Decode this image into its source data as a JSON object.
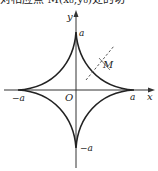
{
  "caption": "对相应点 M(x₀,y₀)处的切",
  "figure": {
    "type": "astroid",
    "equation": "x^(2/3) + y^(2/3) = a^(2/3)",
    "labels": {
      "x_axis": "x",
      "y_axis": "y",
      "origin": "O",
      "a_top": "a",
      "a_right": "a",
      "neg_a_left": "−a",
      "neg_a_bottom": "−a",
      "point": "M"
    },
    "tangent_line": "dashed",
    "colors": {
      "curve": "#222222",
      "axis": "#333333",
      "tangent": "#555555"
    }
  }
}
